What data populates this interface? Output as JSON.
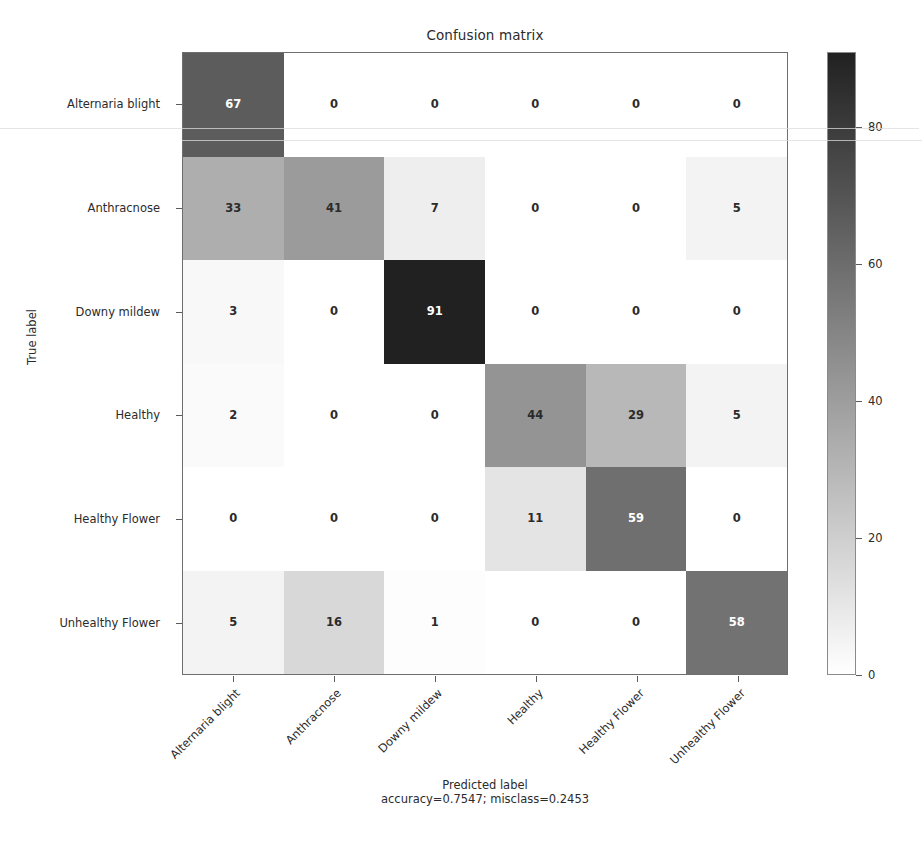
{
  "chart_data": {
    "type": "heatmap",
    "title": "Confusion matrix",
    "xlabel": "Predicted label",
    "xlabel_sub": "accuracy=0.7547; misclass=0.2453",
    "ylabel": "True label",
    "accuracy": "0.7547",
    "misclass": "0.2453",
    "categories": [
      "Alternaria blight",
      "Anthracnose",
      "Downy mildew",
      "Healthy",
      "Healthy Flower",
      "Unhealthy Flower"
    ],
    "x_tick_labels": [
      "Alternaria blight",
      "Anthracnose",
      "Downy mildew",
      "Healthy",
      "Healthy Flower",
      "Unhealthy Flower"
    ],
    "y_tick_labels": [
      "Alternaria blight",
      "Anthracnose",
      "Downy mildew",
      "Healthy",
      "Healthy Flower",
      "Unhealthy Flower"
    ],
    "matrix": [
      [
        67,
        0,
        0,
        0,
        0,
        0
      ],
      [
        33,
        41,
        7,
        0,
        0,
        5
      ],
      [
        3,
        0,
        91,
        0,
        0,
        0
      ],
      [
        2,
        0,
        0,
        44,
        29,
        5
      ],
      [
        0,
        0,
        0,
        11,
        59,
        0
      ],
      [
        5,
        16,
        1,
        0,
        0,
        58
      ]
    ],
    "colormap": "gray_r",
    "colorbar": {
      "ticks": [
        0,
        20,
        40,
        60,
        80
      ],
      "tick_labels": [
        "0",
        "20",
        "40",
        "60",
        "80"
      ],
      "vmin": 0,
      "vmax": 91,
      "position": "right"
    },
    "grid": false,
    "legend": "none",
    "colors": {
      "low": "#ffffff",
      "high": "#2b2b2b",
      "axis": "#6e6e6e",
      "text": "#2b2b2b",
      "text_on_dark": "#ffffff"
    }
  }
}
